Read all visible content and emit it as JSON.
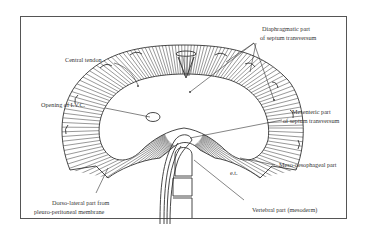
{
  "figure": {
    "type": "anatomical-diagram",
    "labels": {
      "diaphragmatic_part_line1": "Diaphragmatic part",
      "diaphragmatic_part_line2": "of septum transversum",
      "central_tendon": "Central tendon",
      "opening_ivc": "Opening of I.V.C.",
      "mesenteric_part_line1": "Mesenteric part",
      "mesenteric_part_line2": "of septum transversum",
      "meso_oesophageal": "Meso-oesophageal part",
      "dorsolateral_line1": "Dorso-lateral part from",
      "dorsolateral_line2": "pleuro-peritoneal membrane",
      "vertebral_part": "Vertebral part (mesoderm)",
      "small_mark": "e.t."
    }
  }
}
